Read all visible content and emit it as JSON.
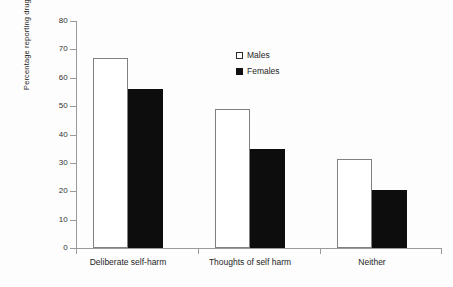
{
  "chart_data": {
    "type": "bar",
    "title": "",
    "xlabel": "",
    "ylabel": "Percentage reporting drug use",
    "categories": [
      "Deliberate self-harm",
      "Thoughts of self harm",
      "Neither"
    ],
    "series": [
      {
        "name": "Males",
        "values": [
          67,
          49,
          31.5
        ],
        "style": "open-white-outline"
      },
      {
        "name": "Females",
        "values": [
          56,
          35,
          20.5
        ],
        "style": "solid-black"
      }
    ],
    "ylim": [
      0,
      80
    ],
    "ytick_step": 10,
    "yticks": [
      0,
      10,
      20,
      30,
      40,
      50,
      60,
      70,
      80
    ],
    "ytick_labels": [
      "0",
      "10",
      "20",
      "30",
      "40",
      "50",
      "60",
      "70",
      "80"
    ],
    "grid": false,
    "legend_position": "upper-center-right",
    "legend_entries": [
      "Males",
      "Females"
    ],
    "colors": {
      "males": "#ffffff",
      "males_outline": "#808080",
      "females": "#0d0d0d",
      "axis": "#9a9a9a",
      "text": "#1f1f1f",
      "background": "#fdfdfd"
    }
  }
}
